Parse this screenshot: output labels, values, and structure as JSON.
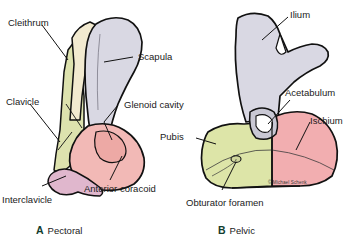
{
  "figure": {
    "credit": "© Michael Schenk",
    "background": "#ffffff"
  },
  "panels": [
    {
      "id": "pectoral",
      "letter": "A",
      "name": "Pectoral",
      "labels": [
        {
          "id": "cleithrum",
          "text": "Cleithrum"
        },
        {
          "id": "scapula",
          "text": "Scapula"
        },
        {
          "id": "clavicle",
          "text": "Clavicle"
        },
        {
          "id": "glenoid-cavity",
          "text": "Glenoid cavity"
        },
        {
          "id": "interclavicle",
          "text": "Interclavicle"
        },
        {
          "id": "anterior-coracoid",
          "text": "Anterior coracoid"
        }
      ]
    },
    {
      "id": "pelvic",
      "letter": "B",
      "name": "Pelvic",
      "labels": [
        {
          "id": "ilium",
          "text": "Ilium"
        },
        {
          "id": "acetabulum",
          "text": "Acetabulum"
        },
        {
          "id": "ischium",
          "text": "Ischium"
        },
        {
          "id": "pubis",
          "text": "Pubis"
        },
        {
          "id": "obturator-foramen",
          "text": "Obturator foramen"
        }
      ]
    }
  ],
  "colors": {
    "outline": "#111111",
    "scapula": "#d9d8e3",
    "cleithrum": "#f2ead0",
    "clavicle": "#dde2ae",
    "interclavicle": "#e0b7cd",
    "anterior_coracoid": "#f2b9b6",
    "ilium": "#d9d8e3",
    "acetabulum": "#c9c8d4",
    "ischium": "#f2aeb0",
    "pubis": "#dde5a8",
    "label_text": "#1a1a1a",
    "caption_letter": "#123d2e"
  }
}
